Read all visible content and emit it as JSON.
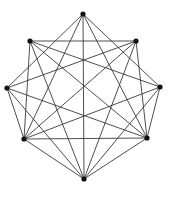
{
  "diagram": {
    "type": "graph",
    "directed": false,
    "colors": {
      "edge": "#3a3a3a",
      "vertex": "#111111",
      "background": "#ffffff"
    },
    "vertices": [
      {
        "id": "A",
        "position": "top",
        "x": 83,
        "y": 14
      },
      {
        "id": "B",
        "position": "upper-right",
        "x": 136,
        "y": 41
      },
      {
        "id": "C",
        "position": "right",
        "x": 160,
        "y": 87
      },
      {
        "id": "D",
        "position": "lower-right",
        "x": 147,
        "y": 138
      },
      {
        "id": "E",
        "position": "bottom",
        "x": 84,
        "y": 179
      },
      {
        "id": "F",
        "position": "lower-left",
        "x": 24,
        "y": 139
      },
      {
        "id": "G",
        "position": "left",
        "x": 7,
        "y": 88
      },
      {
        "id": "H",
        "position": "upper-left",
        "x": 30,
        "y": 41
      }
    ],
    "edges": [
      [
        "A",
        "C"
      ],
      [
        "A",
        "D"
      ],
      [
        "A",
        "E"
      ],
      [
        "A",
        "F"
      ],
      [
        "A",
        "G"
      ],
      [
        "B",
        "D"
      ],
      [
        "B",
        "E"
      ],
      [
        "B",
        "F"
      ],
      [
        "B",
        "G"
      ],
      [
        "B",
        "H"
      ],
      [
        "C",
        "D"
      ],
      [
        "C",
        "E"
      ],
      [
        "C",
        "F"
      ],
      [
        "C",
        "H"
      ],
      [
        "D",
        "E"
      ],
      [
        "D",
        "F"
      ],
      [
        "D",
        "G"
      ],
      [
        "D",
        "H"
      ],
      [
        "E",
        "F"
      ],
      [
        "E",
        "G"
      ],
      [
        "E",
        "H"
      ],
      [
        "F",
        "G"
      ],
      [
        "F",
        "H"
      ]
    ]
  }
}
